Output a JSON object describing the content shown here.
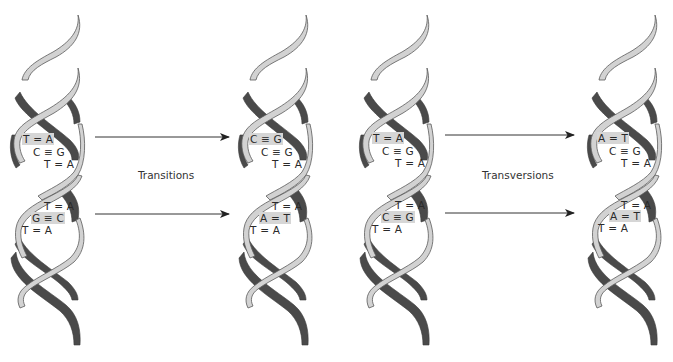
{
  "colors": {
    "front_strand": "#cfcfcf",
    "back_strand": "#4a4a4a",
    "outline": "#6a6a6a",
    "highlight": "#d6d6d6",
    "arrow": "#333333"
  },
  "labels": {
    "transitions": "Transitions",
    "transversions": "Transversions"
  },
  "helices": [
    {
      "name": "original-1",
      "upper": [
        {
          "text": "T = A",
          "highlight": true
        },
        {
          "text": "C ≡ G",
          "highlight": false
        },
        {
          "text": "T = A",
          "highlight": false
        }
      ],
      "lower": [
        {
          "text": "T = A",
          "highlight": false
        },
        {
          "text": "G ≡ C",
          "highlight": true
        },
        {
          "text": "T = A",
          "highlight": false
        }
      ]
    },
    {
      "name": "transition-result",
      "upper": [
        {
          "text": "C ≡ G",
          "highlight": true
        },
        {
          "text": "C ≡ G",
          "highlight": false
        },
        {
          "text": "T = A",
          "highlight": false
        }
      ],
      "lower": [
        {
          "text": "T = A",
          "highlight": false
        },
        {
          "text": "A = T",
          "highlight": true
        },
        {
          "text": "T = A",
          "highlight": false
        }
      ]
    },
    {
      "name": "original-2",
      "upper": [
        {
          "text": "T = A",
          "highlight": true
        },
        {
          "text": "C ≡ G",
          "highlight": false
        },
        {
          "text": "T = A",
          "highlight": false
        }
      ],
      "lower": [
        {
          "text": "T = A",
          "highlight": false
        },
        {
          "text": "C ≡ G",
          "highlight": true
        },
        {
          "text": "T = A",
          "highlight": false
        }
      ]
    },
    {
      "name": "transversion-result",
      "upper": [
        {
          "text": "A = T",
          "highlight": true
        },
        {
          "text": "C ≡ G",
          "highlight": false
        },
        {
          "text": "T = A",
          "highlight": false
        }
      ],
      "lower": [
        {
          "text": "T = A",
          "highlight": false
        },
        {
          "text": "A = T",
          "highlight": true
        },
        {
          "text": "T = A",
          "highlight": false
        }
      ]
    }
  ]
}
